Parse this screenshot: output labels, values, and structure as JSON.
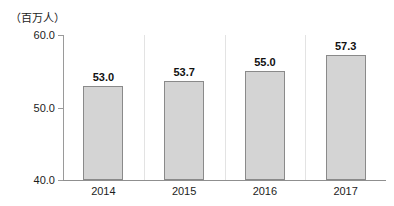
{
  "chart_data": {
    "type": "bar",
    "title": "",
    "subtitle": "",
    "unit_label": "（百万人）",
    "xlabel": "",
    "ylabel": "",
    "categories": [
      "2014",
      "2015",
      "2016",
      "2017"
    ],
    "values": [
      53.0,
      53.7,
      55.0,
      57.3
    ],
    "value_labels": [
      "53.0",
      "53.7",
      "55.0",
      "57.3"
    ],
    "ylim": [
      40.0,
      60.0
    ],
    "ytick_labels": [
      "40.0",
      "50.0",
      "60.0"
    ],
    "yticks": [
      40.0,
      50.0,
      60.0
    ],
    "grid": false,
    "category_separators": true,
    "legend": "none",
    "series": [
      {
        "name": "",
        "values": [
          53.0,
          53.7,
          55.0,
          57.3
        ]
      }
    ],
    "colors": {
      "bar_fill": "#d4d4d4",
      "bar_border": "#8a8a8a",
      "axis": "#8f8f8f",
      "separator": "#e3e3e3",
      "text": "#1c1c1c"
    }
  }
}
